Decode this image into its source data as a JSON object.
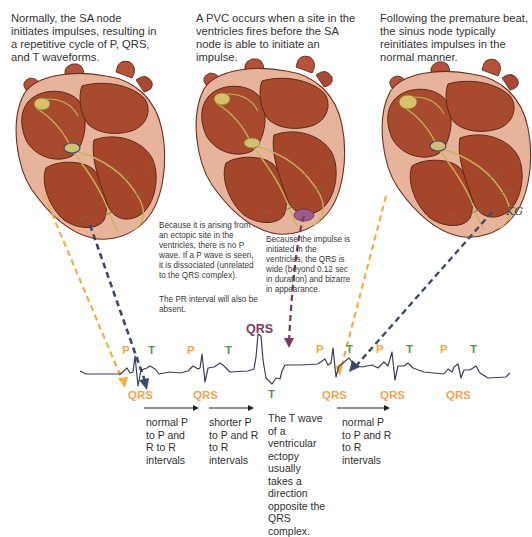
{
  "captions": {
    "normal": "Normally, the SA node initiates impulses, resulting in a repetitive cycle of P, QRS, and T waveforms.",
    "pvc": "A PVC occurs when a site in the ventricles fires before the SA node is able to initiate an impulse.",
    "recovery": "Following the premature beat, the sinus node typically reinitiates impulses in the normal manner."
  },
  "notes": {
    "no_p_wave": "Because it is arising from an ectopic site in the ventricles, there is no P wave.  If a P wave is seen, it is dissociated (unrelated to the QRS complex).",
    "pr_absent": "The PR interval will also be absent.",
    "wide_qrs": "Because the impulse is initiated in the ventricles, the QRS is wide (beyond 0.12 sec in duration) and bizarre in appearance.",
    "t_wave": "The T wave of a ventricular ectopy usually takes a direction opposite the QRS complex."
  },
  "intervals": [
    {
      "id": "first",
      "text": "normal P to P and R to R intervals"
    },
    {
      "id": "second",
      "text": "shorter P to P and R to R intervals"
    },
    {
      "id": "third",
      "text": "normal P to P and R to R intervals"
    }
  ],
  "wave_labels": {
    "p": "P",
    "t": "T",
    "qrs": "QRS",
    "pvc_qrs": "QRS",
    "pvc_t": "T"
  },
  "hearts": [
    {
      "id": "normal-heart",
      "ectopic_focus": false
    },
    {
      "id": "pvc-heart",
      "ectopic_focus": true
    },
    {
      "id": "recovery-heart",
      "ectopic_focus": false
    }
  ],
  "signature": "KG",
  "colors": {
    "p_wave": "#f2a93c",
    "t_wave": "#4f9a4f",
    "qrs": "#f0a258",
    "pvc": "#7a3862",
    "sa_arrow": "#f0b040",
    "av_arrow": "#3b4a6b",
    "ecg_trace": "#3a3f55",
    "heart_muscle": "#a8472c",
    "heart_outer": "#e8b39a"
  }
}
